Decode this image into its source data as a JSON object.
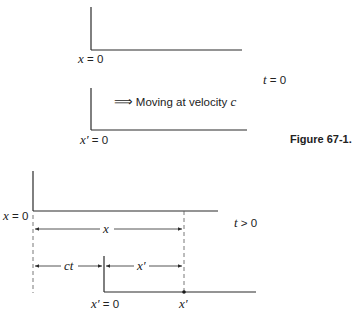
{
  "figure": {
    "caption": "Figure 67-1.",
    "panel_t0": {
      "time_label_var": "t",
      "time_label_rest": " = 0",
      "frame_s": {
        "label_var": "x",
        "label_rest": " = 0"
      },
      "frame_s_prime": {
        "label_var": "x′",
        "label_rest": " = 0"
      },
      "motion": {
        "arrow": "⟹",
        "text": "Moving at velocity ",
        "velocity_var": "c"
      }
    },
    "panel_t_gt_0": {
      "time_label_var": "t",
      "time_label_rest": " > 0",
      "frame_s": {
        "label_var": "x",
        "label_rest": " = 0"
      },
      "frame_s_prime": {
        "label_var": "x′",
        "label_rest": " = 0"
      },
      "distance_x": "x",
      "distance_ct": "ct",
      "distance_x_prime": "x′",
      "point_label": "x′"
    }
  },
  "colors": {
    "line": "#2a2a2a",
    "text": "#222222",
    "background": "#ffffff"
  }
}
